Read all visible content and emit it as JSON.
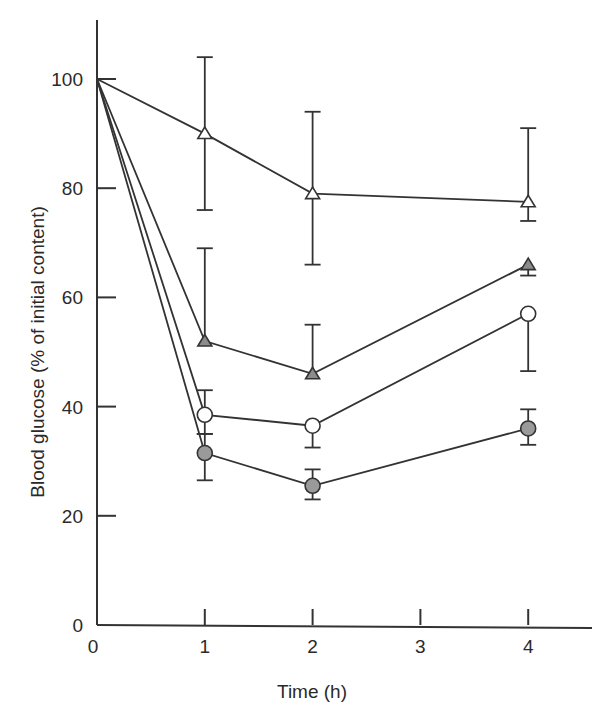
{
  "chart_data": {
    "type": "line",
    "title": "",
    "xlabel": "Time (h)",
    "ylabel": "Blood glucose (% of initial content)",
    "xlim": [
      0,
      4.5
    ],
    "ylim": [
      0,
      110
    ],
    "x_ticks": [
      0,
      1,
      2,
      3,
      4
    ],
    "y_ticks": [
      0,
      20,
      40,
      60,
      80,
      100
    ],
    "grid": false,
    "legend": null,
    "x": [
      0,
      1,
      2,
      4
    ],
    "series": [
      {
        "name": "open-triangle",
        "marker": "triangle",
        "fill": "#ffffff",
        "values": [
          100,
          90,
          79,
          77.5
        ],
        "err_upper": [
          null,
          104,
          94,
          91
        ],
        "err_lower": [
          null,
          76,
          66,
          74
        ]
      },
      {
        "name": "filled-triangle",
        "marker": "triangle",
        "fill": "#8c8c8c",
        "values": [
          100,
          52,
          46,
          66
        ],
        "err_upper": [
          null,
          69,
          55,
          null
        ],
        "err_lower": [
          null,
          null,
          null,
          64
        ]
      },
      {
        "name": "open-circle",
        "marker": "circle",
        "fill": "#ffffff",
        "values": [
          100,
          38.5,
          36.5,
          57
        ],
        "err_upper": [
          null,
          43,
          null,
          null
        ],
        "err_lower": [
          null,
          35,
          32.5,
          46.5
        ]
      },
      {
        "name": "filled-circle",
        "marker": "circle",
        "fill": "#9a9a9a",
        "values": [
          100,
          31.5,
          25.5,
          36
        ],
        "err_upper": [
          null,
          35,
          28.5,
          39.5
        ],
        "err_lower": [
          null,
          26.5,
          23,
          33
        ]
      }
    ]
  }
}
